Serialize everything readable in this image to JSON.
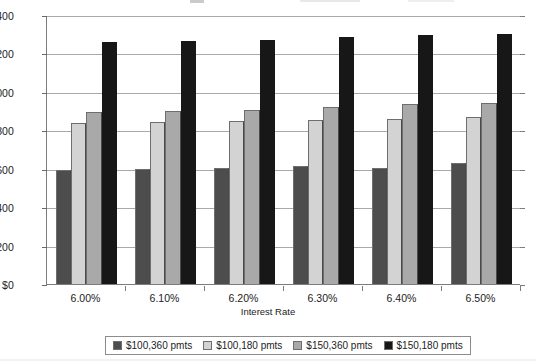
{
  "chart_data": {
    "type": "bar",
    "title": "",
    "xlabel": "Interest Rate",
    "ylabel": "",
    "categories": [
      "6.00%",
      "6.10%",
      "6.20%",
      "6.30%",
      "6.40%",
      "6.50%"
    ],
    "series": [
      {
        "name": "$100,360 pmts",
        "color": "#4d4d4d",
        "values": [
          595,
          600,
          603,
          615,
          603,
          628
        ]
      },
      {
        "name": "$100,180 pmts",
        "color": "#d3d3d3",
        "values": [
          840,
          845,
          850,
          853,
          858,
          868
        ]
      },
      {
        "name": "$150,360 pmts",
        "color": "#a9a9a9",
        "values": [
          895,
          903,
          908,
          923,
          937,
          943
        ]
      },
      {
        "name": "$150,180 pmts",
        "color": "#171717",
        "values": [
          1258,
          1265,
          1268,
          1288,
          1295,
          1303
        ]
      }
    ],
    "ylim": [
      0,
      1400
    ],
    "ytick_step": 200,
    "ytick_labels": [
      "$0",
      "$200",
      "$400",
      "$600",
      "$800",
      "$1,000",
      "$1,200",
      "$1,400"
    ],
    "ytick_values": [
      0,
      200,
      400,
      600,
      800,
      1000,
      1200,
      1400
    ],
    "grid": true,
    "legend_position": "bottom"
  },
  "colors": {
    "axis": "#7d7d7d",
    "gridline": "#a9a9a9",
    "background": "#ffffff",
    "text": "#1c1c1c"
  }
}
